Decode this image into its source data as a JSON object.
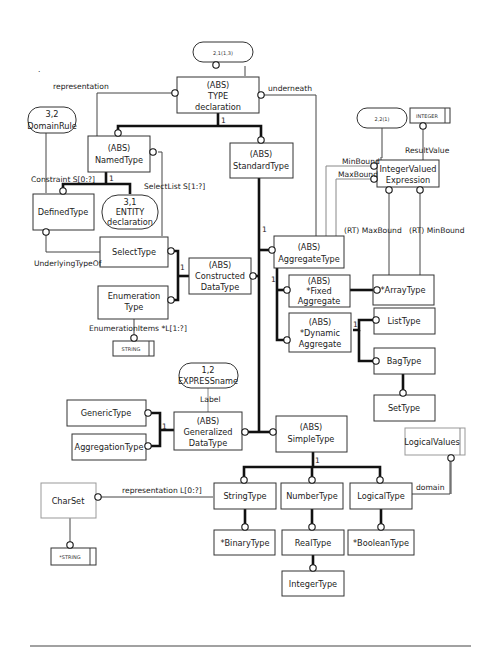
{
  "diagram": {
    "page_refs": {
      "type_decl_ref": "2,1(1,3)",
      "domain_rule_ref": "3,2",
      "domain_rule_name": "DomainRule",
      "entity_ref": "3,1",
      "entity_line1": "ENTITY",
      "entity_line2": "declaration",
      "int_expr_ref": "2,2(1)",
      "express_name_ref": "1,2",
      "express_name": "EXPRESSname"
    },
    "entities": {
      "type_decl": [
        "(ABS)",
        "TYPE",
        "declaration"
      ],
      "named_type": [
        "(ABS)",
        "NamedType"
      ],
      "standard_type": [
        "(ABS)",
        "StandardType"
      ],
      "defined_type": [
        "DefinedType"
      ],
      "select_type": [
        "SelectType"
      ],
      "enumeration_type": [
        "Enumeration",
        "Type"
      ],
      "constructed_data_type": [
        "(ABS)",
        "Constructed",
        "DataType"
      ],
      "aggregate_type": [
        "(ABS)",
        "AggregateType"
      ],
      "fixed_aggregate": [
        "(ABS)",
        "*Fixed",
        "Aggregate"
      ],
      "dynamic_aggregate": [
        "(ABS)",
        "*Dynamic",
        "Aggregate"
      ],
      "array_type": [
        "*ArrayType"
      ],
      "list_type": [
        "ListType"
      ],
      "bag_type": [
        "BagType"
      ],
      "set_type": [
        "SetType"
      ],
      "integer_valued_expression": [
        "IntegerValued",
        "Expression"
      ],
      "generic_type": [
        "GenericType"
      ],
      "aggregation_type": [
        "AggregationType"
      ],
      "generalized_data_type": [
        "(ABS)",
        "Generalized",
        "DataType"
      ],
      "simple_type": [
        "(ABS)",
        "SimpleType"
      ],
      "string_type": [
        "StringType"
      ],
      "number_type": [
        "NumberType"
      ],
      "logical_type": [
        "LogicalType"
      ],
      "binary_type": [
        "*BinaryType"
      ],
      "real_type": [
        "RealType"
      ],
      "boolean_type": [
        "*BooleanType"
      ],
      "integer_type": [
        "IntegerType"
      ],
      "char_set": [
        "CharSet"
      ]
    },
    "simple_types": {
      "integer": "INTEGER",
      "string_enum": "STRING",
      "string_charset": "*STRING",
      "logical_values": "LogicalValues"
    },
    "relationship_labels": {
      "representation": "representation",
      "underneath": "underneath",
      "constraint": "Constraint  S[0:?]",
      "select_list": "SelectList  S[1:?]",
      "underlying_type_of": "UnderlyingTypeOf",
      "enumeration_items": "EnumerationItems  *L[1:?]",
      "min_bound": "MinBound",
      "max_bound": "MaxBound",
      "result_value": "ResultValue",
      "rt_max_bound": "(RT) MaxBound",
      "rt_min_bound": "(RT) MinBound",
      "label": "Label",
      "string_representation": "representation  L[0:?]",
      "domain": "domain"
    },
    "cardinality": {
      "one": "1"
    },
    "stray_mark": "."
  }
}
